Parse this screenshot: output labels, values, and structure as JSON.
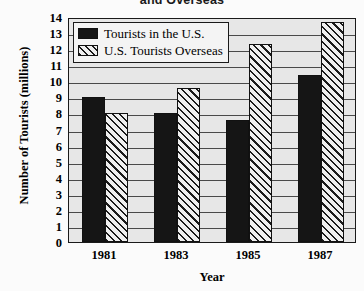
{
  "chart_data": {
    "type": "bar",
    "title": "and Overseas",
    "title_note": "Title is clipped at the top edge of the screenshot; only the second line is visible.",
    "xlabel": "Year",
    "ylabel": "Number of Tourists (millions)",
    "categories": [
      "1981",
      "1983",
      "1985",
      "1987"
    ],
    "series": [
      {
        "name": "Tourists in the U.S.",
        "fill": "solid-black",
        "values": [
          9.0,
          8.0,
          7.6,
          10.4
        ]
      },
      {
        "name": "U.S. Tourists Overseas",
        "fill": "diagonal-hatch",
        "values": [
          8.0,
          9.6,
          12.3,
          13.7
        ]
      }
    ],
    "ylim": [
      0,
      14
    ],
    "yticks": [
      0,
      1,
      2,
      3,
      4,
      5,
      6,
      7,
      8,
      9,
      10,
      11,
      12,
      13,
      14
    ],
    "ytick_labels": [
      "0",
      "1",
      "2",
      "3",
      "4",
      "5",
      "6",
      "7",
      "8",
      "9",
      "10",
      "11",
      "12",
      "13",
      "14"
    ],
    "grid": true,
    "grid_axis": "y",
    "legend_position": "upper-left-inside"
  },
  "style": {
    "plot_background": "#e7e7e7",
    "page_background": "#fbfbfb",
    "axis_color": "#1a1a1a",
    "gridline_color": "#4a4a4a",
    "series_solid_color": "#151515",
    "series_hatch_color": "#1a1a1a",
    "series_hatch_background": "#efefef",
    "legend_background": "#f4f4f4",
    "text_color": "#000000"
  }
}
